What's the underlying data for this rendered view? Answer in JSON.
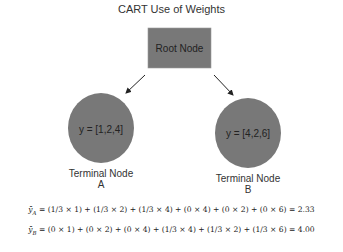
{
  "title": "CART Use of Weights",
  "nodes": {
    "root": {
      "label": "Root Node"
    },
    "a": {
      "content": "y = [1,2,4]",
      "name": "Terminal Node",
      "letter": "A"
    },
    "b": {
      "content": "y = [4,2,6]",
      "name": "Terminal Node",
      "letter": "B"
    }
  },
  "colors": {
    "node_fill": "#787878",
    "edge": "#222222"
  },
  "equations": [
    "ȳ_A = (1/3 × 1) + (1/3 × 2) + (1/3 × 4) + (0 × 4) + (0 × 2) + (0 × 6) = 2.33",
    "ȳ_B = (0 × 1) + (0 × 2) + (0 × 4) + (1/3 × 4) + (1/3 × 2) + (1/3 × 6) = 4.00"
  ],
  "equations_display": [
    {
      "lhs": "ȳ",
      "sub": "A",
      "rhs": " = (1/3 × 1) + (1/3 × 2) + (1/3 × 4) + (0 × 4) + (0 × 2) + (0 × 6) = 2.33"
    },
    {
      "lhs": "ȳ",
      "sub": "B",
      "rhs": " = (0 × 1) + (0 × 2) + (0 × 4) + (1/3 × 4) + (1/3 × 2) + (1/3 × 6) = 4.00"
    }
  ]
}
